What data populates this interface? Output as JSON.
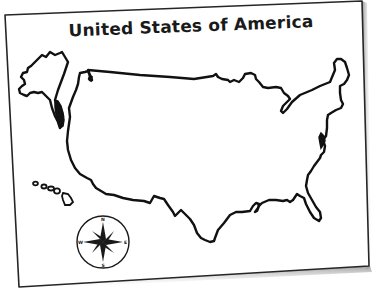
{
  "map": {
    "title": "United States of America",
    "style": "blank outline map printed on tilted sheet of paper",
    "regions": [
      "Alaska",
      "Hawaii",
      "Contiguous United States"
    ],
    "compass_rose": {
      "labels": {
        "north": "N",
        "south": "S",
        "east": "E",
        "west": "W"
      }
    },
    "colors": {
      "paper": "#ffffff",
      "outline": "#111111",
      "paper_border": "#222222",
      "shadow": "#9a9a9a"
    }
  }
}
